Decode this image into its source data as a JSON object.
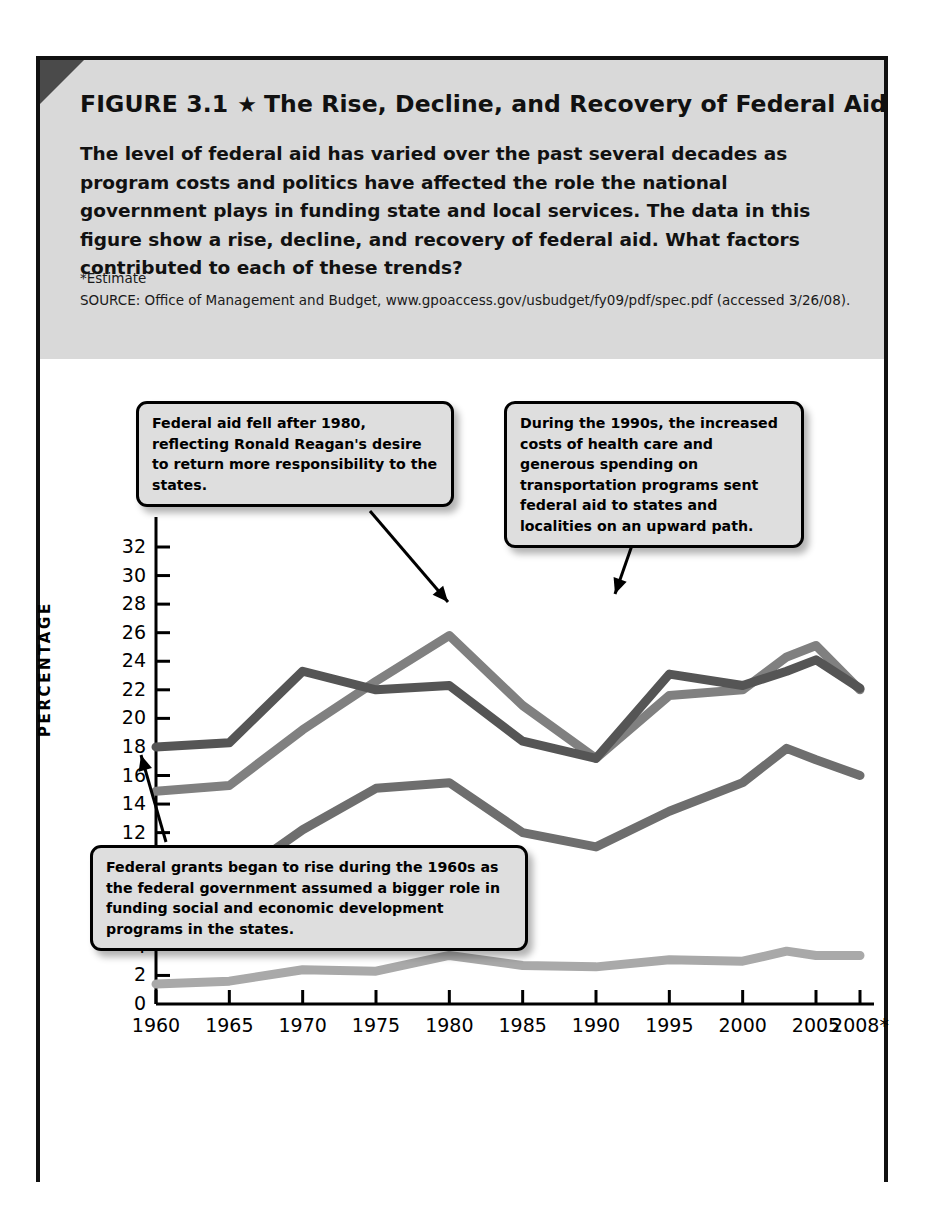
{
  "figure": {
    "title_prefix": "FIGURE 3.1",
    "star": "★",
    "title": "The Rise, Decline, and Recovery of Federal Aid",
    "description": "The level of federal aid has varied over the past several decades as program costs and politics have affected the role the national government plays in funding state and local services. The data in this figure show a rise, decline, and recovery of federal aid. What factors contributed to each of these trends?",
    "estimate_note": "*Estimate",
    "source": "SOURCE: Office of Management and Budget, www.gpoaccess.gov/usbudget/fy09/pdf/spec.pdf (accessed 3/26/08)."
  },
  "chart_data": {
    "type": "line",
    "title": "The Rise, Decline, and Recovery of Federal Aid",
    "xlabel": "",
    "ylabel": "PERCENTAGE",
    "x": [
      1960,
      1965,
      1970,
      1975,
      1980,
      1985,
      1990,
      1995,
      2000,
      2003,
      2005,
      2008
    ],
    "xtick_labels": [
      "1960",
      "1965",
      "1970",
      "1975",
      "1980",
      "1985",
      "1990",
      "1995",
      "2000",
      "2005",
      "2008*"
    ],
    "xtick_values": [
      1960,
      1965,
      1970,
      1975,
      1980,
      1985,
      1990,
      1995,
      2000,
      2005,
      2008
    ],
    "ytick_labels": [
      "0",
      "2",
      "4",
      "6",
      "8",
      "10",
      "12",
      "14",
      "16",
      "18",
      "20",
      "22",
      "24",
      "26",
      "28",
      "30",
      "32"
    ],
    "ylim": [
      0,
      32
    ],
    "xlim": [
      1960,
      2008
    ],
    "grid": false,
    "legend_position": "below-plot",
    "series": [
      {
        "name": "Federal aid as percentage of state/local expenditures",
        "color": "#808080",
        "values": [
          14.9,
          15.3,
          19.2,
          22.6,
          25.8,
          20.9,
          17.2,
          21.6,
          22.0,
          24.3,
          25.1,
          22.0
        ]
      },
      {
        "name": "Federal aid as percentage of federal budget",
        "color": "#555555",
        "values": [
          18.0,
          18.3,
          23.3,
          22.0,
          22.3,
          18.4,
          17.2,
          23.1,
          22.3,
          23.3,
          24.1,
          22.1
        ]
      },
      {
        "name": "Grants-in-aid as percentage of federal domestic programs",
        "color": "#6e6e6e",
        "values": [
          7.8,
          8.6,
          12.2,
          15.1,
          15.5,
          12.0,
          11.0,
          13.5,
          15.5,
          17.9,
          17.1,
          16.0
        ]
      },
      {
        "name": "Grants-in-aid as percentage of gross domestic product",
        "color": "#a9a9a9",
        "values": [
          1.4,
          1.6,
          2.4,
          2.3,
          3.4,
          2.7,
          2.6,
          3.1,
          3.0,
          3.7,
          3.4,
          3.4
        ]
      }
    ],
    "annotations": [
      {
        "id": "callout-0",
        "text": "Federal aid fell after 1980, reflecting Ronald Reagan's desire to return more responsibility to the states.",
        "points_to_year": 1980
      },
      {
        "id": "callout-1",
        "text": "During the 1990s, the increased costs of health care and generous spending on transportation programs sent federal aid to states and localities on an upward path.",
        "points_to_year": 1993
      },
      {
        "id": "callout-2",
        "text": "Federal grants began to rise during the 1960s as the federal government assumed a bigger role in funding social and economic development programs in the states.",
        "points_to_year": 1965
      }
    ]
  },
  "legend": {
    "items": [
      {
        "line1": "Federal aid as percentage",
        "line2": "of state/local expenditures",
        "color": "#808080"
      },
      {
        "line1": "Federal aid as percentage",
        "line2": "of federal budget",
        "color": "#555555"
      },
      {
        "line1": "Grants-in-aid as percentage of",
        "line2": "federal domestic programs",
        "color": "#6e6e6e"
      },
      {
        "line1": "Grants-in-aid as percentage of",
        "line2": "gross domestic product",
        "color": "#a9a9a9"
      }
    ]
  }
}
